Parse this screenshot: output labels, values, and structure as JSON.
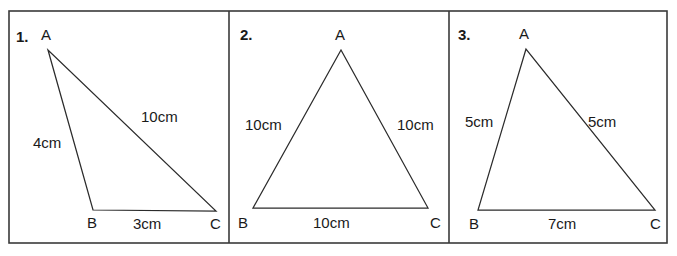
{
  "sheet": {
    "title": "Triangle worksheet",
    "background_color": "#ffffff",
    "border_color": "#3a3a3a",
    "line_color": "#2b2b2b",
    "text_color": "#1a1a1a",
    "frame": {
      "x": 9,
      "y": 11,
      "width": 658,
      "height": 232
    },
    "dividers": [
      229,
      449
    ]
  },
  "panels": [
    {
      "index_label": "1.",
      "name": "scalene-triangle",
      "vertices": {
        "A": {
          "label": "A",
          "x": 48,
          "y": 50,
          "label_x": 41,
          "label_y": 40
        },
        "B": {
          "label": "B",
          "x": 93,
          "y": 210,
          "label_x": 87,
          "label_y": 228
        },
        "C": {
          "label": "C",
          "x": 216,
          "y": 211,
          "label_x": 210,
          "label_y": 229
        }
      },
      "sides": [
        {
          "name": "side-ab",
          "label": "4cm",
          "label_x": 33,
          "label_y": 148
        },
        {
          "name": "side-ac",
          "label": "10cm",
          "label_x": 141,
          "label_y": 122
        },
        {
          "name": "side-bc",
          "label": "3cm",
          "label_x": 133,
          "label_y": 229
        }
      ]
    },
    {
      "index_label": "2.",
      "name": "equilateral-triangle",
      "vertices": {
        "A": {
          "label": "A",
          "x": 341,
          "y": 50,
          "label_x": 335,
          "label_y": 40
        },
        "B": {
          "label": "B",
          "x": 253,
          "y": 208,
          "label_x": 238,
          "label_y": 228
        },
        "C": {
          "label": "C",
          "x": 428,
          "y": 208,
          "label_x": 430,
          "label_y": 228
        }
      },
      "sides": [
        {
          "name": "side-ab",
          "label": "10cm",
          "label_x": 245,
          "label_y": 130
        },
        {
          "name": "side-ac",
          "label": "10cm",
          "label_x": 397,
          "label_y": 130
        },
        {
          "name": "side-bc",
          "label": "10cm",
          "label_x": 313,
          "label_y": 228
        }
      ]
    },
    {
      "index_label": "3.",
      "name": "isosceles-triangle",
      "vertices": {
        "A": {
          "label": "A",
          "x": 526,
          "y": 49,
          "label_x": 519,
          "label_y": 39
        },
        "B": {
          "label": "B",
          "x": 478,
          "y": 210,
          "label_x": 469,
          "label_y": 229
        },
        "C": {
          "label": "C",
          "x": 655,
          "y": 210,
          "label_x": 650,
          "label_y": 229
        }
      },
      "sides": [
        {
          "name": "side-ab",
          "label": "5cm",
          "label_x": 465,
          "label_y": 127
        },
        {
          "name": "side-ac",
          "label": "5cm",
          "label_x": 588,
          "label_y": 127
        },
        {
          "name": "side-bc",
          "label": "7cm",
          "label_x": 548,
          "label_y": 229
        }
      ]
    }
  ],
  "index_label_positions": [
    {
      "x": 16,
      "y": 42
    },
    {
      "x": 240,
      "y": 40
    },
    {
      "x": 458,
      "y": 40
    }
  ]
}
